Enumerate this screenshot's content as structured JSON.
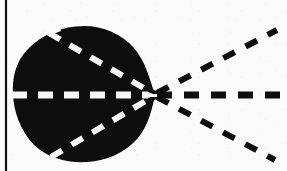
{
  "figure": {
    "kind": "scanned-diagram",
    "title": "",
    "background_color": "#fbfbfb",
    "ink_color": "#0d0d0d",
    "dash_light_color": "#f7f7f7",
    "width": 287,
    "height": 171
  },
  "border": {
    "left_rule": {
      "name": "left-vertical-rule",
      "x": 6,
      "y_top": 0,
      "y_bottom": 171,
      "thickness": 2.2,
      "color": "#111111"
    }
  },
  "blob": {
    "name": "filled-blob",
    "description": "solid black irregular rounded teardrop region",
    "fill": "#0d0d0d",
    "center_x": 84,
    "center_y": 95,
    "radius_x": 72,
    "radius_y": 68,
    "left_edge_x": 13,
    "right_apex_x": 155,
    "top_edge_y": 26,
    "bottom_edge_y": 162
  },
  "focus_point": {
    "name": "convergence-point",
    "x": 155,
    "y": 95,
    "label": ""
  },
  "rays_inside": [
    {
      "name": "ray-inner-upper",
      "stroke": "#f7f7f7",
      "width": 6,
      "dash": "13 11",
      "x1": 49,
      "y1": 33,
      "x2": 154,
      "y2": 94
    },
    {
      "name": "ray-inner-middle",
      "stroke": "#f7f7f7",
      "width": 7,
      "dash": "15 11",
      "x1": 12,
      "y1": 95,
      "x2": 154,
      "y2": 95
    },
    {
      "name": "ray-inner-lower",
      "stroke": "#f7f7f7",
      "width": 6,
      "dash": "13 11",
      "x1": 51,
      "y1": 157,
      "x2": 154,
      "y2": 96
    }
  ],
  "rays_outside": [
    {
      "name": "ray-outer-upper",
      "stroke": "#0d0d0d",
      "width": 6,
      "dash": "13 12",
      "x1": 157,
      "y1": 93,
      "x2": 277,
      "y2": 30
    },
    {
      "name": "ray-outer-middle",
      "stroke": "#0d0d0d",
      "width": 7,
      "dash": "15 12",
      "x1": 157,
      "y1": 95,
      "x2": 285,
      "y2": 95
    },
    {
      "name": "ray-outer-lower",
      "stroke": "#0d0d0d",
      "width": 6,
      "dash": "13 12",
      "x1": 157,
      "y1": 97,
      "x2": 275,
      "y2": 160
    }
  ],
  "notches": [
    {
      "name": "notch-top-left",
      "x": 52,
      "y": 30
    },
    {
      "name": "notch-bottom-left",
      "x": 55,
      "y": 159
    }
  ]
}
